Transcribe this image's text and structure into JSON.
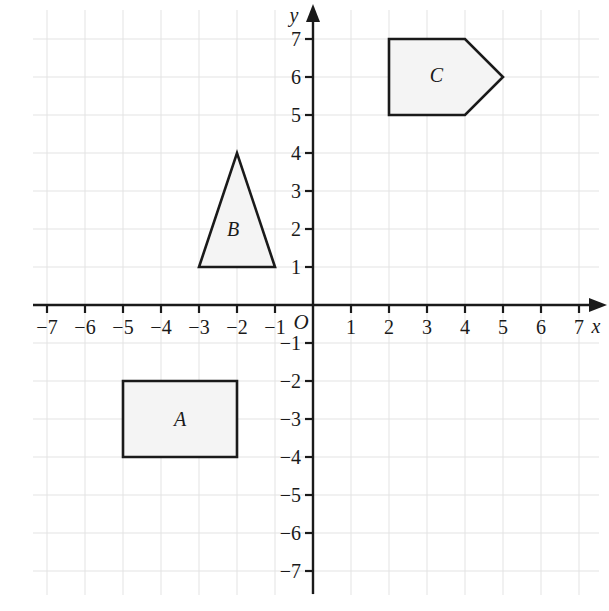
{
  "chart_data": {
    "type": "scatter",
    "title": "",
    "xlabel": "x",
    "ylabel": "y",
    "origin_label": "O",
    "grid": true,
    "xlim": [
      -7.55,
      7.75
    ],
    "ylim": [
      -7.75,
      7.55
    ],
    "x_ticks": [
      -7,
      -6,
      -5,
      -4,
      -3,
      -2,
      -1,
      1,
      2,
      3,
      4,
      5,
      6,
      7
    ],
    "y_ticks": [
      -7,
      -6,
      -5,
      -4,
      -3,
      -2,
      -1,
      1,
      2,
      3,
      4,
      5,
      6,
      7
    ],
    "x_tick_labels": [
      "−7",
      "−6",
      "−5",
      "−4",
      "−3",
      "−2",
      "−1",
      "1",
      "2",
      "3",
      "4",
      "5",
      "6",
      "7"
    ],
    "y_tick_labels": [
      "−7",
      "−6",
      "−5",
      "−4",
      "−3",
      "−2",
      "−1",
      "1",
      "2",
      "3",
      "4",
      "5",
      "6",
      "7"
    ],
    "shapes": [
      {
        "label": "A",
        "kind": "rectangle",
        "points": [
          [
            -5,
            -2
          ],
          [
            -2,
            -2
          ],
          [
            -2,
            -4
          ],
          [
            -5,
            -4
          ]
        ],
        "label_at": [
          -3.5,
          -3
        ],
        "fill": "#f4f4f4",
        "stroke": "#1a1a1a"
      },
      {
        "label": "B",
        "kind": "triangle",
        "points": [
          [
            -3,
            1
          ],
          [
            -1,
            1
          ],
          [
            -2,
            4
          ]
        ],
        "label_at": [
          -2.1,
          2
        ],
        "fill": "#f4f4f4",
        "stroke": "#1a1a1a"
      },
      {
        "label": "C",
        "kind": "pentagon",
        "points": [
          [
            2,
            7
          ],
          [
            4,
            7
          ],
          [
            5,
            6
          ],
          [
            4,
            5
          ],
          [
            2,
            5
          ]
        ],
        "label_at": [
          3.25,
          6.05
        ],
        "fill": "#f4f4f4",
        "stroke": "#1a1a1a"
      }
    ],
    "colors": {
      "grid_line": "#e3e3e3",
      "axis_line": "#1a1a1a",
      "shape_fill": "#f4f4f4",
      "shape_stroke": "#1a1a1a",
      "background": "#ffffff"
    }
  }
}
